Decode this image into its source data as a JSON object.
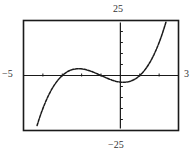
{
  "chart_data": {
    "type": "line",
    "title": "",
    "xlabel": "",
    "ylabel": "",
    "function": "f(x) = x^3 + 3x^2 - x - 3",
    "xlim": [
      -5,
      3
    ],
    "ylim": [
      -25,
      25
    ],
    "x_tick_step": 1,
    "y_tick_step": 5,
    "grid": false,
    "legend": null,
    "window_labels": {
      "xmin": "−5",
      "xmax": "3",
      "ymin": "−25",
      "ymax": "25"
    },
    "key_points": {
      "roots": [
        -3,
        -1,
        1
      ],
      "local_max": [
        -2.15,
        3.08
      ],
      "local_min": [
        0.15,
        -3.08
      ],
      "y_intercept": [
        0,
        -3
      ]
    },
    "series": [
      {
        "name": "f(x)",
        "x": [
          -4.3,
          -4.0,
          -3.5,
          -3.0,
          -2.5,
          -2.15,
          -2.0,
          -1.5,
          -1.0,
          -0.5,
          0.0,
          0.15,
          0.5,
          1.0,
          1.5,
          2.0,
          2.35
        ],
        "values": [
          -22.1,
          -15.0,
          -5.6,
          0.0,
          2.6,
          3.1,
          3.0,
          1.9,
          0.0,
          -1.9,
          -3.0,
          -3.1,
          -2.6,
          0.0,
          5.6,
          15.0,
          24.8
        ]
      }
    ]
  },
  "colors": {
    "frame": "#1a1a1a",
    "axis": "#1a1a1a",
    "curve": "#1a1a1a",
    "background": "#ffffff"
  }
}
